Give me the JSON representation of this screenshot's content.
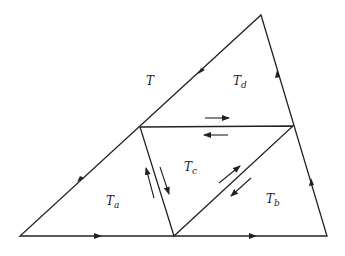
{
  "labels": {
    "T": "T",
    "Ta_base": "T",
    "Ta_sub": "a",
    "Tb_base": "T",
    "Tb_sub": "b",
    "Tc_base": "T",
    "Tc_sub": "c",
    "Td_base": "T",
    "Td_sub": "d"
  },
  "colors": {
    "stroke": "#222222",
    "background": "#ffffff"
  }
}
